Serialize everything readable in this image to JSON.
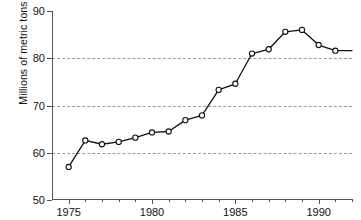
{
  "chart_data": {
    "type": "line",
    "title": "",
    "xlabel": "",
    "ylabel": "Millions of metric tons",
    "xlim": [
      1974.0,
      1992.0
    ],
    "ylim": [
      50,
      90
    ],
    "yticks": [
      50,
      60,
      70,
      80,
      90
    ],
    "ytick_labels": [
      "50",
      "60",
      "70",
      "80",
      "90"
    ],
    "xticks": [
      1975,
      1980,
      1985,
      1990
    ],
    "xtick_labels": [
      "1975",
      "1980",
      "1985",
      "1990"
    ],
    "xticks_minor": [
      1976,
      1977,
      1978,
      1979,
      1981,
      1982,
      1983,
      1984,
      1986,
      1987,
      1988,
      1989,
      1991,
      1992
    ],
    "grid": "horizontal dashed at 60, 70, 80",
    "gridlines": [
      60,
      70,
      80
    ],
    "legend": "none",
    "marker": "open-circle",
    "line_color": "#111111",
    "marker_face_color": "#ffffff",
    "x": [
      1975,
      1976,
      1977,
      1978,
      1979,
      1980,
      1981,
      1982,
      1983,
      1984,
      1985,
      1986,
      1987,
      1988,
      1989,
      1990,
      1991,
      1992
    ],
    "values": [
      57.0,
      62.6,
      61.8,
      62.3,
      63.2,
      64.3,
      64.5,
      66.9,
      67.9,
      73.3,
      74.6,
      81.0,
      81.9,
      85.6,
      86.0,
      82.8,
      81.6,
      81.6
    ],
    "series": [
      {
        "name": "Millions of metric tons",
        "values": [
          57.0,
          62.6,
          61.8,
          62.3,
          63.2,
          64.3,
          64.5,
          66.9,
          67.9,
          73.3,
          74.6,
          81.0,
          81.9,
          85.6,
          86.0,
          82.8,
          81.6,
          81.6
        ]
      }
    ]
  }
}
